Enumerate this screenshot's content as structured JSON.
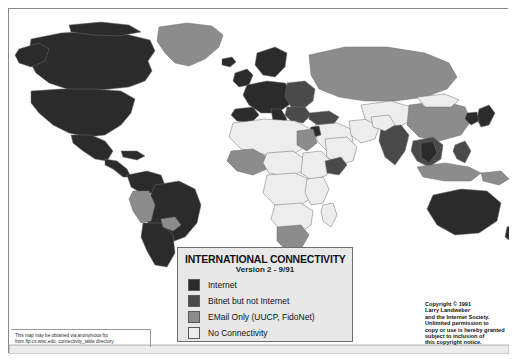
{
  "poster": {
    "title": "INTERNATIONAL CONNECTIVITY",
    "subtitle": "Version 2  -  9/91"
  },
  "legend": {
    "title": "INTERNATIONAL CONNECTIVITY",
    "subtitle": "Version 2  -  9/91",
    "items": [
      {
        "label": "Internet",
        "color": "#2b2b2b"
      },
      {
        "label": "Bitnet but not Internet",
        "color": "#4a4a4a"
      },
      {
        "label": "EMail Only (UUCP, FidoNet)",
        "color": "#8c8c8c"
      },
      {
        "label": "No Connectivity",
        "color": "#ededed"
      }
    ]
  },
  "copyright": {
    "lines": [
      "Copyright © 1991",
      "Larry Landweber",
      "and the Internet Society.",
      "Unlimited permission to",
      "copy or use is hereby granted",
      "subject to inclusion of",
      "this copyright notice."
    ]
  },
  "ftp_note": {
    "lines": [
      "This map may be obtained via anonymous ftp",
      "from ftp.cs.wisc.edu, connectivity_table directory"
    ]
  },
  "colors": {
    "internet": "#2b2b2b",
    "bitnet": "#4a4a4a",
    "email_only": "#8c8c8c",
    "none": "#ededed",
    "ocean": "#ffffff",
    "border": "#6d6d6d",
    "legend_bg": "#e8e8e8"
  },
  "map": {
    "projection": "equirectangular-world",
    "regions": [
      {
        "name": "greenland",
        "status": "email_only",
        "path": "M150,18 L178,14 L203,17 L214,26 L210,38 L196,50 L180,57 L166,54 L156,44 L148,32 Z"
      },
      {
        "name": "iceland",
        "status": "internet",
        "path": "M213,50 L223,48 L227,53 L221,58 L213,56 Z"
      },
      {
        "name": "canada",
        "status": "internet",
        "path": "M22,30 L52,24 L84,22 L116,25 L141,31 L146,42 L139,52 L143,62 L136,72 L120,78 L101,80 L79,82 L58,80 L40,74 L27,64 L19,50 Z"
      },
      {
        "name": "alaska",
        "status": "internet",
        "path": "M10,40 L30,34 L40,40 L36,52 L22,58 L10,54 L6,46 Z"
      },
      {
        "name": "canada-arctic-isles",
        "status": "internet",
        "path": "M60,16 L92,13 L120,16 L132,23 L110,27 L84,26 L62,23 Z"
      },
      {
        "name": "united-states",
        "status": "internet",
        "path": "M22,82 L52,80 L84,80 L112,82 L126,90 L122,104 L112,116 L96,126 L78,128 L60,124 L44,116 L30,104 L22,94 Z"
      },
      {
        "name": "mexico",
        "status": "internet",
        "path": "M62,126 L82,126 L96,132 L104,142 L98,152 L86,150 L74,142 L64,134 Z"
      },
      {
        "name": "central-america",
        "status": "internet",
        "path": "M96,150 L108,152 L118,160 L122,168 L114,168 L104,160 L96,156 Z"
      },
      {
        "name": "cuba-caribbean",
        "status": "internet",
        "path": "M112,142 L128,142 L136,147 L128,151 L114,148 Z"
      },
      {
        "name": "colombia-venezuela",
        "status": "internet",
        "path": "M118,166 L138,162 L152,166 L156,176 L146,184 L132,184 L122,178 Z"
      },
      {
        "name": "brazil",
        "status": "internet",
        "path": "M146,176 L170,172 L186,180 L192,196 L188,214 L176,228 L160,234 L146,228 L138,212 L138,194 Z"
      },
      {
        "name": "peru-bolivia",
        "status": "email_only",
        "path": "M124,182 L140,182 L146,196 L142,212 L132,214 L124,202 L120,190 Z"
      },
      {
        "name": "chile-argentina",
        "status": "internet",
        "path": "M134,214 L152,214 L164,226 L166,244 L158,258 L146,256 L138,242 L132,228 Z"
      },
      {
        "name": "paraguay-uruguay",
        "status": "email_only",
        "path": "M152,210 L166,208 L172,216 L164,222 L154,218 Z"
      },
      {
        "name": "british-isles",
        "status": "internet",
        "path": "M226,64 L238,60 L244,66 L240,76 L230,78 L224,72 Z"
      },
      {
        "name": "scandinavia",
        "status": "internet",
        "path": "M248,44 L266,38 L278,44 L276,58 L266,68 L254,66 L246,56 Z"
      },
      {
        "name": "western-europe",
        "status": "internet",
        "path": "M238,76 L258,72 L276,74 L284,84 L280,96 L268,104 L252,104 L240,96 L234,86 Z"
      },
      {
        "name": "iberia",
        "status": "internet",
        "path": "M226,100 L244,98 L250,106 L242,114 L228,112 L222,106 Z"
      },
      {
        "name": "italy",
        "status": "internet",
        "path": "M262,100 L272,100 L278,110 L272,118 L264,112 Z"
      },
      {
        "name": "eastern-europe",
        "status": "bitnet",
        "path": "M278,74 L296,72 L306,80 L304,92 L294,100 L282,98 L276,88 Z"
      },
      {
        "name": "balkans-greece",
        "status": "bitnet",
        "path": "M278,98 L296,98 L302,106 L294,114 L282,112 L276,106 Z"
      },
      {
        "name": "soviet-union",
        "status": "email_only",
        "path": "M300,46 L336,38 L378,38 L416,44 L440,54 L448,68 L438,80 L416,88 L386,92 L356,92 L330,88 L310,80 L302,66 Z"
      },
      {
        "name": "turkey",
        "status": "bitnet",
        "path": "M300,104 L320,102 L330,108 L324,116 L308,116 L300,110 Z"
      },
      {
        "name": "middle-east",
        "status": "none",
        "path": "M306,116 L328,114 L342,120 L344,134 L334,144 L318,142 L308,132 Z"
      },
      {
        "name": "saudi-arabia",
        "status": "none",
        "path": "M316,130 L338,128 L348,138 L344,152 L330,156 L318,148 Z"
      },
      {
        "name": "israel",
        "status": "internet",
        "path": "M302,118 L310,117 L312,126 L305,128 L300,123 Z"
      },
      {
        "name": "iran",
        "status": "none",
        "path": "M340,112 L360,110 L370,118 L366,130 L352,134 L342,126 Z"
      },
      {
        "name": "central-asia",
        "status": "none",
        "path": "M352,96 L382,92 L402,98 L404,110 L390,118 L370,118 L356,110 Z"
      },
      {
        "name": "north-africa",
        "status": "none",
        "path": "M224,114 L256,110 L286,112 L302,120 L300,136 L286,144 L258,146 L232,140 L220,128 Z"
      },
      {
        "name": "egypt",
        "status": "email_only",
        "path": "M288,122 L304,120 L308,134 L298,142 L288,136 Z"
      },
      {
        "name": "west-africa",
        "status": "email_only",
        "path": "M222,142 L244,140 L258,148 L258,160 L244,166 L228,162 L218,152 Z"
      },
      {
        "name": "sahel",
        "status": "none",
        "path": "M258,144 L284,142 L296,150 L294,162 L278,168 L260,164 L254,154 Z"
      },
      {
        "name": "sudan-ethiopia",
        "status": "none",
        "path": "M294,144 L312,142 L322,152 L318,166 L304,172 L292,164 Z"
      },
      {
        "name": "horn-of-africa",
        "status": "bitnet",
        "path": "M316,152 L332,148 L338,156 L330,166 L318,164 Z"
      },
      {
        "name": "central-africa",
        "status": "none",
        "path": "M258,166 L286,164 L304,172 L304,188 L288,198 L266,196 L254,184 Z"
      },
      {
        "name": "east-africa",
        "status": "none",
        "path": "M298,170 L314,168 L320,180 L314,194 L302,196 L296,184 Z"
      },
      {
        "name": "southern-africa",
        "status": "none",
        "path": "M266,196 L292,194 L304,202 L302,216 L288,226 L272,222 L262,210 Z"
      },
      {
        "name": "south-africa",
        "status": "email_only",
        "path": "M268,218 L292,216 L300,226 L292,240 L278,242 L268,232 Z"
      },
      {
        "name": "madagascar",
        "status": "none",
        "path": "M314,196 L324,194 L328,206 L322,218 L314,212 L312,202 Z"
      },
      {
        "name": "india",
        "status": "bitnet",
        "path": "M372,118 L392,116 L400,126 L396,142 L386,156 L376,148 L370,132 Z"
      },
      {
        "name": "pakistan-afghanistan",
        "status": "none",
        "path": "M362,108 L380,106 L386,116 L376,122 L364,118 Z"
      },
      {
        "name": "china",
        "status": "email_only",
        "path": "M400,96 L434,92 L456,98 L462,112 L452,126 L430,132 L410,128 L398,116 Z"
      },
      {
        "name": "mongolia",
        "status": "none",
        "path": "M408,88 L436,85 L450,91 L442,98 L416,98 Z"
      },
      {
        "name": "japan",
        "status": "internet",
        "path": "M470,100 L480,96 L486,104 L480,116 L472,118 L468,110 Z"
      },
      {
        "name": "korea",
        "status": "internet",
        "path": "M458,104 L468,103 L470,112 L462,116 L456,110 Z"
      },
      {
        "name": "southeast-asia",
        "status": "bitnet",
        "path": "M404,132 L424,128 L434,136 L432,150 L420,158 L408,152 L402,142 Z"
      },
      {
        "name": "thailand",
        "status": "internet",
        "path": "M412,134 L424,132 L428,144 L420,154 L412,148 Z"
      },
      {
        "name": "philippines",
        "status": "bitnet",
        "path": "M446,136 L456,132 L462,142 L456,154 L448,150 L444,142 Z"
      },
      {
        "name": "indonesia",
        "status": "email_only",
        "path": "M408,158 L436,154 L460,158 L472,164 L462,172 L436,172 L414,168 Z"
      },
      {
        "name": "papua-new-guinea",
        "status": "email_only",
        "path": "M472,164 L492,162 L500,170 L490,176 L474,172 Z"
      },
      {
        "name": "australia",
        "status": "internet",
        "path": "M424,186 L452,180 L478,182 L492,194 L488,212 L470,224 L446,226 L428,216 L418,200 Z"
      },
      {
        "name": "new-zealand",
        "status": "internet",
        "path": "M498,218 L508,214 L512,224 L504,234 L496,228 Z"
      },
      {
        "name": "antarctica-edge",
        "status": "none",
        "path": "M0,336 L500,336 L500,345 L0,345 Z"
      }
    ]
  }
}
